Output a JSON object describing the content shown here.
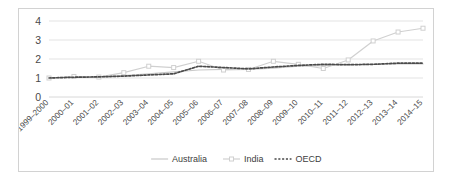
{
  "chart_data": {
    "type": "line",
    "title": "",
    "subtitle": "",
    "xlabel": "",
    "ylabel": "",
    "ylim": [
      0,
      4
    ],
    "yticks": [
      0,
      1,
      2,
      3,
      4
    ],
    "grid": true,
    "legend_position": "bottom",
    "categories": [
      "1999–2000",
      "2000–01",
      "2001–02",
      "2002–03",
      "2003–04",
      "2004–05",
      "2005–06",
      "2006–07",
      "2007–08",
      "2008–09",
      "2009–10",
      "2010–11",
      "2011–12",
      "2012–13",
      "2013–14",
      "2014–15"
    ],
    "series": [
      {
        "name": "Australia",
        "color": "#c9c9c9",
        "style": "solid",
        "markers": false,
        "values": [
          1.0,
          1.05,
          1.05,
          1.12,
          1.22,
          1.32,
          1.42,
          1.45,
          1.45,
          1.52,
          1.62,
          1.65,
          1.7,
          1.72,
          1.74,
          1.74
        ]
      },
      {
        "name": "India",
        "color": "#d0d0d0",
        "style": "solid",
        "markers": true,
        "values": [
          1.0,
          1.08,
          1.05,
          1.28,
          1.62,
          1.55,
          1.88,
          1.42,
          1.45,
          1.88,
          1.72,
          1.5,
          1.95,
          2.95,
          3.42,
          3.62
        ]
      },
      {
        "name": "OECD",
        "color": "#4a4a4a",
        "style": "dotted",
        "markers": false,
        "values": [
          1.0,
          1.04,
          1.06,
          1.1,
          1.16,
          1.22,
          1.62,
          1.55,
          1.48,
          1.58,
          1.66,
          1.72,
          1.7,
          1.72,
          1.78,
          1.78
        ]
      }
    ],
    "legend_entries": [
      "Australia",
      "India",
      "OECD"
    ]
  },
  "axis": {
    "y_tick_0": "0",
    "y_tick_1": "1",
    "y_tick_2": "2",
    "y_tick_3": "3",
    "y_tick_4": "4"
  },
  "legend": {
    "australia": "Australia",
    "india": "India",
    "oecd": "OECD"
  }
}
